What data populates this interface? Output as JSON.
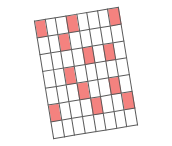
{
  "figure": {
    "type": "grid-diagram",
    "background_color": "#ffffff",
    "rotation_degrees": -9.3
  },
  "grid": {
    "columns": 8,
    "rows": 7,
    "cell_size_px": 17,
    "line_color": "#5a5a5a",
    "empty_color": "#ffffff",
    "filled_color": "#f4827f",
    "filled_count": 12,
    "empty_count": 44,
    "cells": [
      [
        1,
        0,
        0,
        1,
        0,
        0,
        0,
        1
      ],
      [
        0,
        0,
        1,
        0,
        0,
        0,
        0,
        0
      ],
      [
        0,
        0,
        0,
        0,
        1,
        0,
        1,
        0
      ],
      [
        0,
        0,
        1,
        0,
        0,
        0,
        0,
        0
      ],
      [
        0,
        0,
        0,
        1,
        0,
        0,
        1,
        0
      ],
      [
        1,
        0,
        0,
        0,
        1,
        0,
        0,
        1
      ],
      [
        0,
        0,
        0,
        0,
        0,
        0,
        0,
        0
      ]
    ],
    "filled_coordinates": [
      "r1c1",
      "r1c4",
      "r1c8",
      "r2c3",
      "r3c5",
      "r3c7",
      "r4c3",
      "r5c4",
      "r5c7",
      "r6c1",
      "r6c5",
      "r6c8"
    ]
  }
}
